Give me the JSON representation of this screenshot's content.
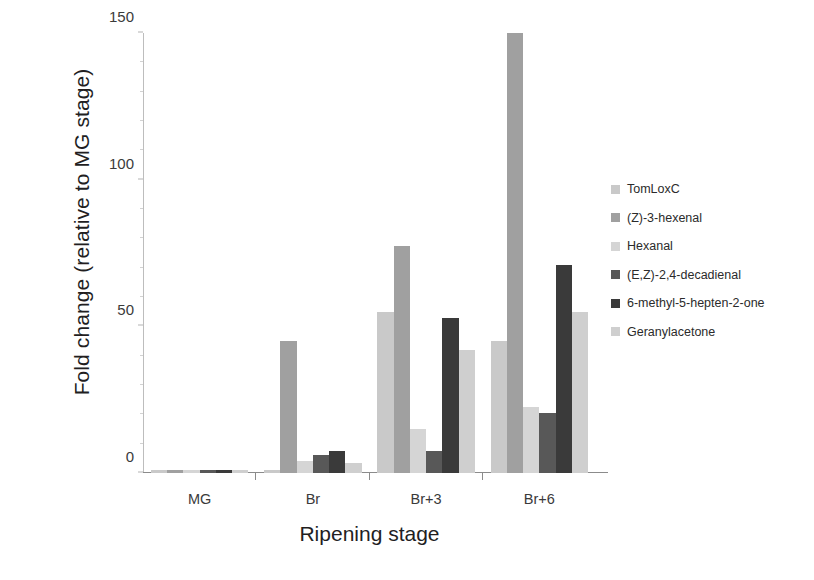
{
  "chart_data": {
    "type": "bar",
    "title": "",
    "xlabel": "Ripening stage",
    "ylabel": "Fold change (relative to MG stage)",
    "categories": [
      "MG",
      "Br",
      "Br+3",
      "Br+6"
    ],
    "ylim": [
      0,
      150
    ],
    "yticks": [
      0,
      50,
      100,
      150
    ],
    "ytick_labels": [
      "0",
      "50",
      "100",
      "150"
    ],
    "grid": false,
    "legend_position": "right",
    "series": [
      {
        "name": "TomLoxC",
        "color": "#c9c9c9",
        "values": [
          1,
          1,
          55,
          45
        ]
      },
      {
        "name": "(Z)-3-hexenal",
        "color": "#a0a0a0",
        "values": [
          1,
          45,
          77.5,
          150
        ]
      },
      {
        "name": "Hexanal",
        "color": "#d5d5d5",
        "values": [
          1,
          4,
          15,
          22.5
        ]
      },
      {
        "name": "(E,Z)-2,4-decadienal",
        "color": "#585858",
        "values": [
          1,
          6,
          7.5,
          20.5
        ]
      },
      {
        "name": "6-methyl-5-hepten-2-one",
        "color": "#3a3a3a",
        "values": [
          1,
          7.5,
          53,
          71
        ]
      },
      {
        "name": "Geranylacetone",
        "color": "#cfcfcf",
        "values": [
          1,
          3.5,
          42,
          55
        ]
      }
    ]
  }
}
